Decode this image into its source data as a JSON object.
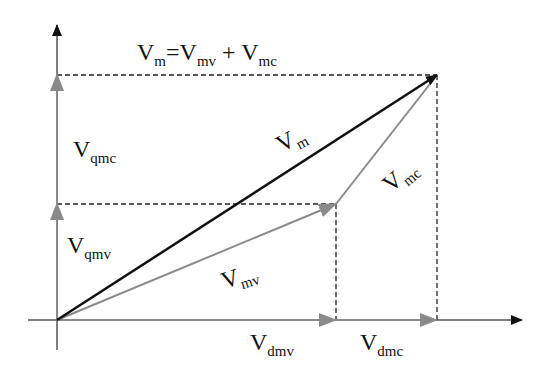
{
  "diagram": {
    "equation": {
      "v": "V",
      "m": "m",
      "eq": "=V",
      "mv": "mv",
      "plus": " + V",
      "mc": "mc"
    },
    "labels": {
      "vqmc": {
        "base": "V",
        "sub": "qmc"
      },
      "vqmv": {
        "base": "V",
        "sub": "qmv"
      },
      "vm": {
        "base": "V",
        "sub": "m"
      },
      "vmc": {
        "base": "V",
        "sub": "mc"
      },
      "vmv": {
        "base": "V",
        "sub": "mv"
      },
      "vdmv": {
        "base": "V",
        "sub": "dmv"
      },
      "vdmc": {
        "base": "V",
        "sub": "dmc"
      }
    },
    "colors": {
      "black": "#111111",
      "gray": "#8a8a8a",
      "dash": "#222222"
    }
  }
}
